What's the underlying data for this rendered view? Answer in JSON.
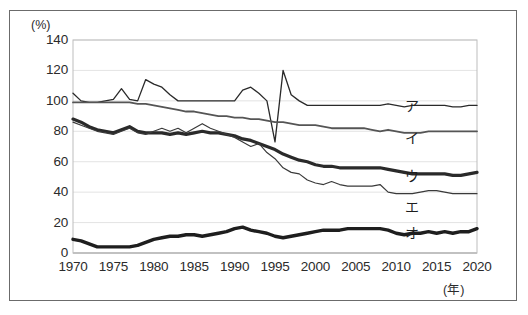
{
  "chart_data": {
    "type": "line",
    "title": "",
    "xlabel": "(年)",
    "ylabel": "(%)",
    "xlim": [
      1970,
      2020
    ],
    "ylim": [
      0,
      140
    ],
    "grid": true,
    "grid_axis": "y",
    "legend_position": "inline-right",
    "x_ticks": [
      "1970",
      "1975",
      "1980",
      "1985",
      "1990",
      "1995",
      "2000",
      "2005",
      "2010",
      "2015",
      "2020"
    ],
    "y_ticks": [
      "0",
      "20",
      "40",
      "60",
      "80",
      "100",
      "120",
      "140"
    ],
    "x": [
      1970,
      1971,
      1972,
      1973,
      1974,
      1975,
      1976,
      1977,
      1978,
      1979,
      1980,
      1981,
      1982,
      1983,
      1984,
      1985,
      1986,
      1987,
      1988,
      1989,
      1990,
      1991,
      1992,
      1993,
      1994,
      1995,
      1996,
      1997,
      1998,
      1999,
      2000,
      2001,
      2002,
      2003,
      2004,
      2005,
      2006,
      2007,
      2008,
      2009,
      2010,
      2011,
      2012,
      2013,
      2014,
      2015,
      2016,
      2017,
      2018,
      2019,
      2020
    ],
    "series": [
      {
        "name": "ア",
        "label": "ア",
        "style": "thin-dark",
        "color": "#2a2a2a",
        "width": 1.3,
        "values": [
          105,
          100,
          99,
          99,
          100,
          101,
          108,
          101,
          100,
          114,
          111,
          109,
          104,
          100,
          100,
          100,
          100,
          100,
          100,
          100,
          100,
          107,
          109,
          105,
          100,
          73,
          120,
          104,
          100,
          97,
          97,
          97,
          97,
          97,
          97,
          97,
          97,
          97,
          97,
          98,
          97,
          96,
          97,
          97,
          97,
          97,
          97,
          96,
          96,
          97,
          97
        ]
      },
      {
        "name": "イ",
        "label": "イ",
        "style": "medium-gray",
        "color": "#555555",
        "width": 1.8,
        "values": [
          99,
          99,
          99,
          99,
          99,
          99,
          99,
          99,
          98,
          98,
          97,
          96,
          95,
          94,
          93,
          93,
          92,
          91,
          90,
          90,
          89,
          89,
          88,
          88,
          87,
          86,
          86,
          85,
          84,
          84,
          84,
          83,
          82,
          82,
          82,
          82,
          82,
          81,
          80,
          81,
          80,
          79,
          79,
          79,
          80,
          80,
          80,
          80,
          80,
          80,
          80
        ]
      },
      {
        "name": "ウ",
        "label": "ウ",
        "style": "thick-dark",
        "color": "#2a2a2a",
        "width": 3.2,
        "values": [
          88,
          86,
          83,
          81,
          80,
          79,
          81,
          83,
          80,
          79,
          79,
          79,
          78,
          79,
          78,
          79,
          80,
          79,
          79,
          78,
          77,
          75,
          74,
          72,
          70,
          68,
          65,
          63,
          61,
          60,
          58,
          57,
          57,
          56,
          56,
          56,
          56,
          56,
          56,
          55,
          54,
          53,
          52,
          52,
          52,
          52,
          52,
          51,
          51,
          52,
          53
        ]
      },
      {
        "name": "エ",
        "label": "エ",
        "style": "thin-dark2",
        "color": "#3a3a3a",
        "width": 1.2,
        "values": [
          86,
          84,
          82,
          80,
          79,
          78,
          80,
          82,
          79,
          78,
          80,
          82,
          80,
          82,
          79,
          82,
          85,
          82,
          80,
          78,
          76,
          73,
          70,
          72,
          66,
          62,
          56,
          53,
          52,
          48,
          46,
          45,
          47,
          45,
          44,
          44,
          44,
          44,
          45,
          40,
          39,
          39,
          39,
          40,
          41,
          41,
          40,
          39,
          39,
          39,
          39
        ]
      },
      {
        "name": "オ",
        "label": "オ",
        "style": "thick-dark2",
        "color": "#1e1e1e",
        "width": 3.4,
        "values": [
          9,
          8,
          6,
          4,
          4,
          4,
          4,
          4,
          5,
          7,
          9,
          10,
          11,
          11,
          12,
          12,
          11,
          12,
          13,
          14,
          16,
          17,
          15,
          14,
          13,
          11,
          10,
          11,
          12,
          13,
          14,
          15,
          15,
          15,
          16,
          16,
          16,
          16,
          16,
          15,
          13,
          12,
          13,
          13,
          14,
          13,
          14,
          13,
          14,
          14,
          16
        ]
      }
    ]
  },
  "labels": {
    "unit_percent": "(%)",
    "unit_year": "(年)"
  }
}
